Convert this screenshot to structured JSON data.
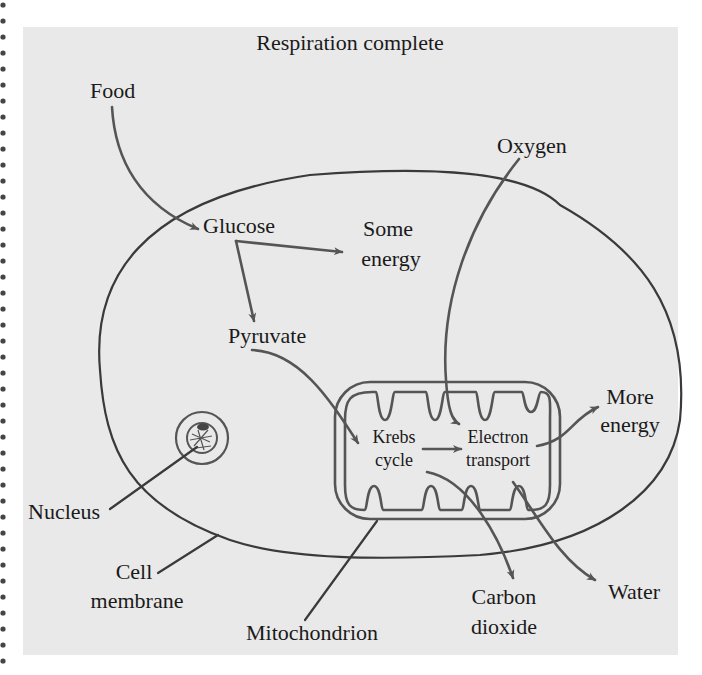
{
  "diagram": {
    "title": "Respiration complete",
    "labels": {
      "food": "Food",
      "oxygen": "Oxygen",
      "glucose": "Glucose",
      "some_energy_1": "Some",
      "some_energy_2": "energy",
      "pyruvate": "Pyruvate",
      "krebs_1": "Krebs",
      "krebs_2": "cycle",
      "electron_1": "Electron",
      "electron_2": "transport",
      "more_energy_1": "More",
      "more_energy_2": "energy",
      "nucleus": "Nucleus",
      "cell_membrane_1": "Cell",
      "cell_membrane_2": "membrane",
      "mitochondrion": "Mitochondrion",
      "carbon_dioxide_1": "Carbon",
      "carbon_dioxide_2": "dioxide",
      "water": "Water"
    },
    "flows": [
      {
        "from": "Food",
        "to": "Glucose"
      },
      {
        "from": "Glucose",
        "to": "Some energy"
      },
      {
        "from": "Glucose",
        "to": "Pyruvate"
      },
      {
        "from": "Pyruvate",
        "to": "Krebs cycle"
      },
      {
        "from": "Krebs cycle",
        "to": "Electron transport"
      },
      {
        "from": "Oxygen",
        "to": "Electron transport"
      },
      {
        "from": "Electron transport",
        "to": "More energy"
      },
      {
        "from": "Krebs cycle",
        "to": "Carbon dioxide"
      },
      {
        "from": "Electron transport",
        "to": "Water"
      }
    ],
    "structures": [
      "Cell membrane",
      "Nucleus",
      "Mitochondrion"
    ],
    "colors": {
      "background": "#e9e9e9",
      "line": "#555555",
      "text": "#1a1a1a"
    }
  }
}
